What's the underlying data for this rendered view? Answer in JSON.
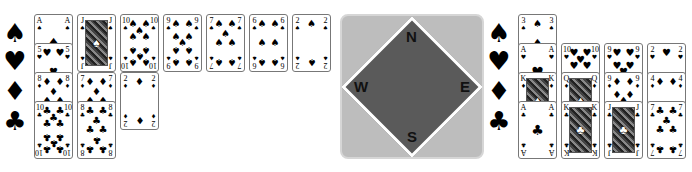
{
  "hands": {
    "west": {
      "position": "left",
      "suits": [
        {
          "suit": "spades",
          "symbol": "♠",
          "cards": [
            "A",
            "J",
            "10",
            "9",
            "7",
            "6",
            "2"
          ]
        },
        {
          "suit": "hearts",
          "symbol": "♥",
          "cards": [
            "5"
          ]
        },
        {
          "suit": "diamonds",
          "symbol": "♦",
          "cards": [
            "8",
            "7",
            "2"
          ]
        },
        {
          "suit": "clubs",
          "symbol": "♣",
          "cards": [
            "10",
            "8"
          ]
        }
      ]
    },
    "east": {
      "position": "right",
      "suits": [
        {
          "suit": "spades",
          "symbol": "♠",
          "cards": [
            "3"
          ]
        },
        {
          "suit": "hearts",
          "symbol": "♥",
          "cards": [
            "A",
            "10",
            "9",
            "2"
          ]
        },
        {
          "suit": "diamonds",
          "symbol": "♦",
          "cards": [
            "K",
            "Q",
            "9",
            "4"
          ]
        },
        {
          "suit": "clubs",
          "symbol": "♣",
          "cards": [
            "A",
            "K",
            "J",
            "7"
          ]
        }
      ]
    }
  },
  "compass": {
    "north": "N",
    "south": "S",
    "east": "E",
    "west": "W",
    "colors": {
      "outer": "#bdbdbd",
      "inner": "#5a5a5a",
      "border": "#ffffff"
    }
  }
}
